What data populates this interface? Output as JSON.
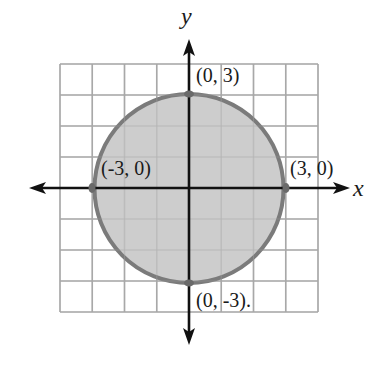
{
  "figure": {
    "type": "diagram",
    "axes": {
      "x_label": "x",
      "y_label": "y",
      "grid": {
        "min": -4,
        "max": 4,
        "step": 1
      }
    },
    "circle": {
      "center": [
        0,
        0
      ],
      "radius": 3,
      "fill": "#c9c9c9",
      "stroke": "#7b7b7b"
    },
    "points": [
      {
        "id": "top",
        "coords": [
          0,
          3
        ],
        "label": "(0, 3)"
      },
      {
        "id": "left",
        "coords": [
          -3,
          0
        ],
        "label": "(-3, 0)"
      },
      {
        "id": "right",
        "coords": [
          3,
          0
        ],
        "label": "(3, 0)"
      },
      {
        "id": "bottom",
        "coords": [
          0,
          -3
        ],
        "label": "(0, -3)."
      }
    ],
    "colors": {
      "grid": "#a8a8a8",
      "axis": "#111111",
      "point": "#6a6a6a"
    }
  }
}
